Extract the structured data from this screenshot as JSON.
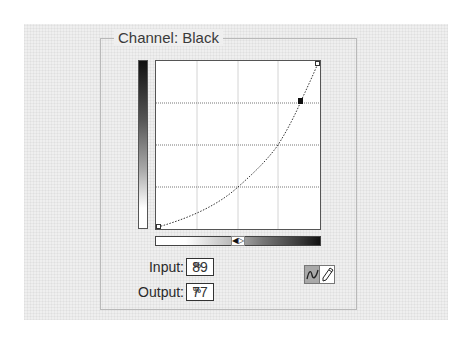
{
  "channel": {
    "label": "Channel: Black",
    "value": "Black"
  },
  "curve": {
    "grid_divisions": 4,
    "points": [
      {
        "input": 0,
        "output": 0
      },
      {
        "input": 50,
        "output": 25
      },
      {
        "input": 75,
        "output": 50
      },
      {
        "input": 89,
        "output": 77
      },
      {
        "input": 100,
        "output": 100
      }
    ],
    "selected_point_index": 3
  },
  "fields": {
    "input": {
      "label": "Input:",
      "value": "89",
      "unit": "%"
    },
    "output": {
      "label": "Output:",
      "value": "77",
      "unit": "%"
    }
  },
  "tools": {
    "curve_tool": {
      "icon": "curve-icon",
      "selected": true
    },
    "pencil_tool": {
      "icon": "pencil-icon",
      "selected": false
    }
  },
  "gradient_toggle": {
    "icon": "swap-arrows-icon",
    "glyph": "◀▷"
  },
  "colors": {
    "panel_bg": "#efefef",
    "panel_border": "#b9b9b9",
    "curve": "#333333",
    "selected_tool_bg": "#a9a9a9"
  }
}
